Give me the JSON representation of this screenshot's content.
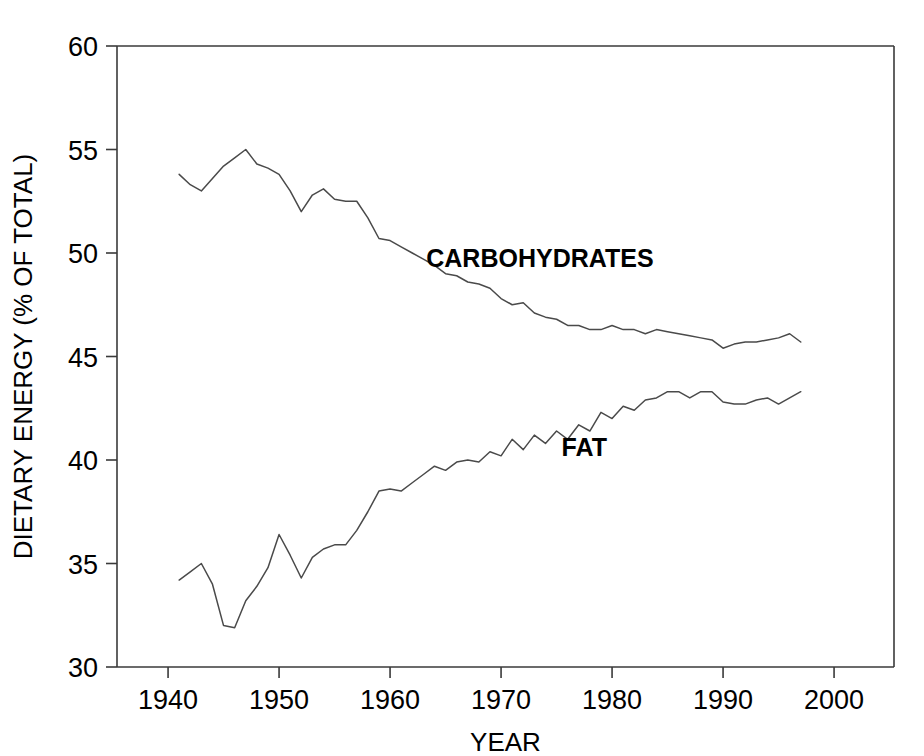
{
  "chart_data": {
    "type": "line",
    "title": "",
    "xlabel": "YEAR",
    "ylabel": "DIETARY ENERGY (% OF TOTAL)",
    "xlim": [
      1935.4,
      2005.4
    ],
    "ylim": [
      30,
      60
    ],
    "xticks": [
      1940,
      1950,
      1960,
      1970,
      1980,
      1990,
      2000
    ],
    "yticks": [
      30,
      35,
      40,
      45,
      50,
      55,
      60
    ],
    "xtick_labels": [
      "1940",
      "1950",
      "1960",
      "1970",
      "1980",
      "1990",
      "2000"
    ],
    "ytick_labels": [
      "30",
      "35",
      "40",
      "45",
      "50",
      "55",
      "60"
    ],
    "grid": false,
    "legend_position": "inline-annotation",
    "line_color": "#4a4a4a",
    "axis_color": "#3a3a3a",
    "x": [
      1941,
      1942,
      1943,
      1944,
      1945,
      1946,
      1947,
      1948,
      1949,
      1950,
      1951,
      1952,
      1953,
      1954,
      1955,
      1956,
      1957,
      1958,
      1959,
      1960,
      1961,
      1962,
      1963,
      1964,
      1965,
      1966,
      1967,
      1968,
      1969,
      1970,
      1971,
      1972,
      1973,
      1974,
      1975,
      1976,
      1977,
      1978,
      1979,
      1980,
      1981,
      1982,
      1983,
      1984,
      1985,
      1986,
      1987,
      1988,
      1989,
      1990,
      1991,
      1992,
      1993,
      1994,
      1995,
      1996,
      1997
    ],
    "series": [
      {
        "name": "CARBOHYDRATES",
        "label_x": 1973.5,
        "label_y": 49.3,
        "values": [
          53.8,
          53.3,
          53.0,
          53.6,
          54.2,
          54.6,
          55.0,
          54.3,
          54.1,
          53.8,
          53.0,
          52.0,
          52.8,
          53.1,
          52.6,
          52.5,
          52.5,
          51.7,
          50.7,
          50.6,
          50.3,
          50.0,
          49.7,
          49.4,
          49.0,
          48.9,
          48.6,
          48.5,
          48.3,
          47.8,
          47.5,
          47.6,
          47.1,
          46.9,
          46.8,
          46.5,
          46.5,
          46.3,
          46.3,
          46.5,
          46.3,
          46.3,
          46.1,
          46.3,
          46.2,
          46.1,
          46.0,
          45.9,
          45.8,
          45.4,
          45.6,
          45.7,
          45.7,
          45.8,
          45.9,
          46.1,
          45.7
        ]
      },
      {
        "name": "FAT",
        "label_x": 1977.5,
        "label_y": 40.2,
        "values": [
          34.2,
          34.6,
          35.0,
          34.0,
          32.0,
          31.9,
          33.2,
          33.9,
          34.8,
          36.4,
          35.4,
          34.3,
          35.3,
          35.7,
          35.9,
          35.9,
          36.6,
          37.5,
          38.5,
          38.6,
          38.5,
          38.9,
          39.3,
          39.7,
          39.5,
          39.9,
          40.0,
          39.9,
          40.4,
          40.2,
          41.0,
          40.5,
          41.2,
          40.8,
          41.4,
          41.0,
          41.7,
          41.4,
          42.3,
          42.0,
          42.6,
          42.4,
          42.9,
          43.0,
          43.3,
          43.3,
          43.0,
          43.3,
          43.3,
          42.8,
          42.7,
          42.7,
          42.9,
          43.0,
          42.7,
          43.0,
          43.3
        ]
      }
    ]
  }
}
